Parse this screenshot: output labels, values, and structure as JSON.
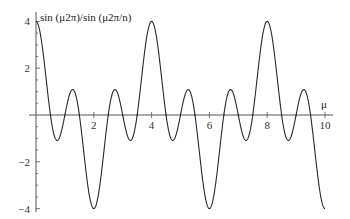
{
  "chart_data": {
    "type": "line",
    "title": "sin (μ2π)/sin (μ2π/n)",
    "ylabel": "sin (μ2π)/sin (μ2π/n)",
    "xlabel": "μ",
    "function": "sin(2πμ)/sin(2πμ/n), n = 4",
    "xlim": [
      0,
      10
    ],
    "ylim": [
      -4,
      4
    ],
    "x_ticks": [
      2,
      4,
      6,
      8,
      10
    ],
    "x_tick_labels": [
      "2",
      "4",
      "6",
      "8",
      "10"
    ],
    "y_ticks": [
      -4,
      -2,
      2,
      4
    ],
    "y_tick_labels": [
      "−4",
      "−2",
      "2",
      "4"
    ],
    "grid": false,
    "legend": null,
    "series": [
      {
        "name": "sin (μ2π)/sin (μ2π/n)",
        "key_points": {
          "maxima": [
            [
              0,
              4
            ],
            [
              4,
              4
            ],
            [
              8,
              4
            ]
          ],
          "minima": [
            [
              2,
              -4
            ],
            [
              6,
              -4
            ],
            [
              10,
              -4
            ]
          ],
          "secondary_extrema_approx": [
            [
              0.6,
              -1.0
            ],
            [
              1.3,
              1.0
            ],
            [
              2.7,
              1.0
            ],
            [
              3.4,
              -1.0
            ],
            [
              4.6,
              -1.0
            ],
            [
              5.3,
              1.0
            ],
            [
              6.7,
              1.0
            ],
            [
              7.4,
              -1.0
            ],
            [
              8.6,
              -1.0
            ],
            [
              9.3,
              1.0
            ]
          ]
        }
      }
    ]
  },
  "axes": {
    "x_axis_label": "μ",
    "y_axis_label": "sin (μ2π)/sin (μ2π/n)"
  }
}
